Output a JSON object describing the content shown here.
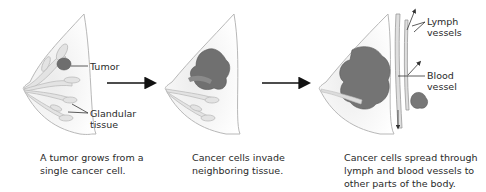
{
  "diagram": {
    "type": "process-sequence",
    "panels": [
      {
        "id": "stage-1",
        "labels": {
          "tumor": "Tumor",
          "glandular": "Glandular\ntissue"
        },
        "caption_lines": [
          "A tumor grows from a",
          "single cancer cell."
        ]
      },
      {
        "id": "stage-2",
        "caption_lines": [
          "Cancer cells invade",
          "neighboring tissue."
        ]
      },
      {
        "id": "stage-3",
        "labels": {
          "lymph": "Lymph\nvessels",
          "blood": "Blood\nvessel"
        },
        "caption_lines": [
          "Cancer cells spread through",
          "lymph and blood vessels to",
          "other parts of the body."
        ]
      }
    ],
    "colors": {
      "breast_fill": "#f1f1f1",
      "outline": "#b5b5b5",
      "gland": "#d7d7d7",
      "tumor": "#6f6f6f",
      "arrow": "#111111"
    }
  }
}
